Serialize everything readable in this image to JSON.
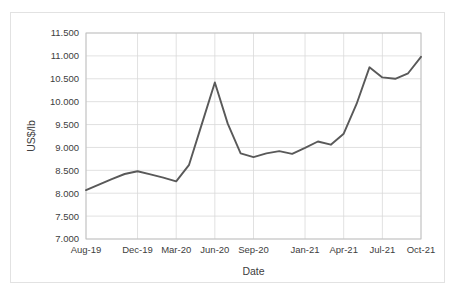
{
  "chart_data": {
    "type": "line",
    "title": "",
    "xlabel": "Date",
    "ylabel": "US$/lb",
    "ylim": [
      7.0,
      11.5
    ],
    "ytick_step": 0.5,
    "ytick_labels": [
      "7.000",
      "7.500",
      "8.000",
      "8.500",
      "9.000",
      "9.500",
      "10.000",
      "10.500",
      "11.000",
      "11.500"
    ],
    "ytick_values": [
      7.0,
      7.5,
      8.0,
      8.5,
      9.0,
      9.5,
      10.0,
      10.5,
      11.0,
      11.5
    ],
    "xtick_labels": [
      "Aug-19",
      "Dec-19",
      "Mar-20",
      "Jun-20",
      "Sep-20",
      "Jan-21",
      "Apr-21",
      "Jul-21",
      "Oct-21"
    ],
    "xtick_indices": [
      0,
      4,
      7,
      10,
      13,
      17,
      20,
      23,
      26
    ],
    "grid": true,
    "legend": "none",
    "line_color": "#595959",
    "line_width": 1.9,
    "x": [
      "Aug-19",
      "Sep-19",
      "Oct-19",
      "Nov-19",
      "Dec-19",
      "Jan-20",
      "Feb-20",
      "Mar-20",
      "Apr-20",
      "May-20",
      "Jun-20",
      "Jul-20",
      "Aug-20",
      "Sep-20",
      "Oct-20",
      "Nov-20",
      "Dec-20",
      "Jan-21",
      "Feb-21",
      "Mar-21",
      "Apr-21",
      "May-21",
      "Jun-21",
      "Jul-21",
      "Aug-21",
      "Sep-21",
      "Oct-21"
    ],
    "values": [
      8.07,
      8.19,
      8.31,
      8.42,
      8.48,
      8.41,
      8.34,
      8.26,
      8.62,
      9.52,
      10.42,
      9.52,
      8.87,
      8.79,
      8.87,
      8.92,
      8.86,
      8.99,
      9.13,
      9.06,
      9.3,
      9.95,
      10.75,
      10.53,
      10.5,
      10.62,
      10.98
    ]
  },
  "footnote": {
    "text": ""
  }
}
